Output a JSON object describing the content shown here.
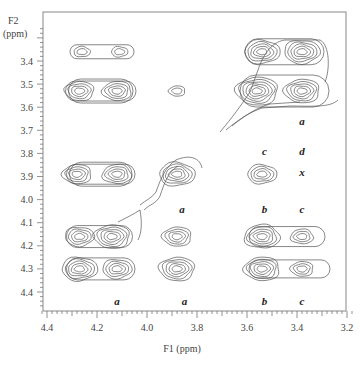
{
  "chart_data": {
    "type": "contour",
    "subtype": "2D NMR (homonuclear correlation) contour plot",
    "title": "",
    "xlabel": "F1 (ppm)",
    "ylabel": "F2\n(ppm)",
    "ylabel_lines": [
      "F2",
      "(ppm)"
    ],
    "xlim": [
      4.42,
      3.18
    ],
    "ylim": [
      3.25,
      4.48
    ],
    "x_reversed": true,
    "y_reversed": true,
    "x_ticks": [
      4.4,
      4.2,
      4.0,
      3.8,
      3.6,
      3.4,
      3.2
    ],
    "x_tick_labels": [
      "4.4",
      "4.2",
      "4.0",
      "3.8",
      "3.6",
      "3.4",
      "3.2"
    ],
    "y_ticks": [
      3.4,
      3.5,
      3.6,
      3.7,
      3.8,
      3.9,
      4.0,
      4.1,
      4.2,
      4.3,
      4.4
    ],
    "y_tick_labels": [
      "3.4",
      "3.5",
      "3.6",
      "3.7",
      "3.8",
      "3.9",
      "4.0",
      "4.1",
      "4.2",
      "4.3",
      "4.4"
    ],
    "grid": false,
    "legend": null,
    "peaks": [
      {
        "f1": 4.26,
        "f2": 3.36,
        "levels": 2
      },
      {
        "f1": 4.11,
        "f2": 3.36,
        "levels": 2
      },
      {
        "f1": 4.27,
        "f2": 3.53,
        "levels": 4
      },
      {
        "f1": 4.12,
        "f2": 3.53,
        "levels": 4
      },
      {
        "f1": 3.88,
        "f2": 3.53,
        "levels": 2
      },
      {
        "f1": 3.54,
        "f2": 3.36,
        "levels": 5
      },
      {
        "f1": 3.38,
        "f2": 3.36,
        "levels": 5
      },
      {
        "f1": 3.56,
        "f2": 3.53,
        "levels": 6
      },
      {
        "f1": 3.38,
        "f2": 3.53,
        "levels": 5
      },
      {
        "f1": 4.28,
        "f2": 3.89,
        "levels": 4
      },
      {
        "f1": 4.12,
        "f2": 3.89,
        "levels": 4
      },
      {
        "f1": 3.88,
        "f2": 3.89,
        "levels": 5
      },
      {
        "f1": 3.54,
        "f2": 3.89,
        "levels": 4
      },
      {
        "f1": 4.27,
        "f2": 4.16,
        "levels": 4
      },
      {
        "f1": 4.14,
        "f2": 4.16,
        "levels": 5
      },
      {
        "f1": 3.88,
        "f2": 4.16,
        "levels": 4
      },
      {
        "f1": 3.54,
        "f2": 4.16,
        "levels": 5
      },
      {
        "f1": 3.38,
        "f2": 4.16,
        "levels": 3
      },
      {
        "f1": 4.27,
        "f2": 4.3,
        "levels": 5
      },
      {
        "f1": 4.12,
        "f2": 4.3,
        "levels": 4
      },
      {
        "f1": 3.88,
        "f2": 4.3,
        "levels": 5
      },
      {
        "f1": 3.54,
        "f2": 4.3,
        "levels": 5
      },
      {
        "f1": 3.38,
        "f2": 4.3,
        "levels": 3
      }
    ],
    "annotations": [
      {
        "text": "a",
        "f1": 3.38,
        "f2": 3.66
      },
      {
        "text": "c",
        "f1": 3.53,
        "f2": 3.79
      },
      {
        "text": "d",
        "f1": 3.38,
        "f2": 3.79
      },
      {
        "text": "x",
        "f1": 3.38,
        "f2": 3.88
      },
      {
        "text": "a",
        "f1": 3.86,
        "f2": 4.04
      },
      {
        "text": "b",
        "f1": 3.53,
        "f2": 4.04
      },
      {
        "text": "c",
        "f1": 3.38,
        "f2": 4.04
      },
      {
        "text": "a",
        "f1": 4.12,
        "f2": 4.44
      },
      {
        "text": "a",
        "f1": 3.85,
        "f2": 4.44
      },
      {
        "text": "b",
        "f1": 3.53,
        "f2": 4.44
      },
      {
        "text": "c",
        "f1": 3.38,
        "f2": 4.44
      }
    ]
  },
  "axes": {
    "x_label": "F1 (ppm)",
    "y_label_line1": "F2",
    "y_label_line2": "(ppm)"
  }
}
